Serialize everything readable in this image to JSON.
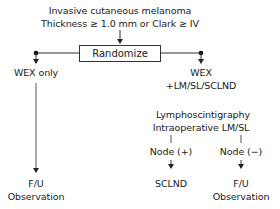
{
  "diagram": {
    "type": "flowchart",
    "header": {
      "line1": "Invasive cutaneous melanoma",
      "line2": "Thickness ≥ 1.0 mm or Clark ≥ IV"
    },
    "randomize_label": "Randomize",
    "left_arm": {
      "label": "WEX only",
      "outcome_line1": "F/U",
      "outcome_line2": "Observation"
    },
    "right_arm": {
      "label_line1": "WEX",
      "label_line2": "+LM/SL/SCLND",
      "procedure_line1": "Lymphoscintigraphy",
      "procedure_line2": "Intraoperative LM/SL",
      "node_positive": {
        "label": "Node (+)",
        "outcome": "SCLND"
      },
      "node_negative": {
        "label": "Node (−)",
        "outcome_line1": "F/U",
        "outcome_line2": "Observation"
      }
    },
    "colors": {
      "line": "#333333",
      "text": "#222222",
      "background": "#ffffff"
    }
  }
}
